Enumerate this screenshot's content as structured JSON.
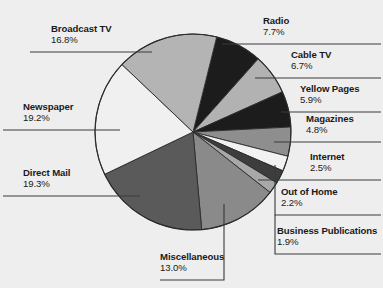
{
  "chart_data": {
    "type": "pie",
    "title": "",
    "subtitle": "",
    "xlabel": "",
    "ylabel": "",
    "legend_position": "callout-labels",
    "grid": false,
    "unit": "%",
    "categories": [
      "Radio",
      "Cable TV",
      "Yellow Pages",
      "Magazines",
      "Internet",
      "Out of Home",
      "Business Publications",
      "Miscellaneous",
      "Direct Mail",
      "Newspaper",
      "Broadcast TV"
    ],
    "values": [
      7.7,
      6.7,
      5.9,
      4.8,
      2.5,
      2.2,
      1.9,
      13.0,
      19.3,
      19.2,
      16.8
    ],
    "value_labels": [
      "7.7%",
      "6.7%",
      "5.9%",
      "4.8%",
      "2.5%",
      "2.2%",
      "1.9%",
      "13.0%",
      "19.3%",
      "19.2%",
      "16.8%"
    ],
    "slice_colors": [
      "#1c1c1c",
      "#b2b2b2",
      "#1c1c1c",
      "#8e8e8e",
      "#f2f2f2",
      "#3d3d3d",
      "#a8a8a8",
      "#8a8a8a",
      "#5a5a5a",
      "#f0f0f0",
      "#b4b4b4"
    ],
    "total": 100.0
  },
  "style": {
    "background": "#eeeeee",
    "text_color": "#1a1a1a",
    "outline_color": "#2b2b2b",
    "leader_color": "#3a3a3a"
  },
  "labels": {
    "radio": {
      "name": "Radio",
      "pct": "7.7%"
    },
    "cable_tv": {
      "name": "Cable TV",
      "pct": "6.7%"
    },
    "yellow_pages": {
      "name": "Yellow Pages",
      "pct": "5.9%"
    },
    "magazines": {
      "name": "Magazines",
      "pct": "4.8%"
    },
    "internet": {
      "name": "Internet",
      "pct": "2.5%"
    },
    "out_of_home": {
      "name": "Out of Home",
      "pct": "2.2%"
    },
    "business_publications": {
      "name": "Business Publications",
      "pct": "1.9%"
    },
    "miscellaneous": {
      "name": "Miscellaneous",
      "pct": "13.0%"
    },
    "direct_mail": {
      "name": "Direct Mail",
      "pct": "19.3%"
    },
    "newspaper": {
      "name": "Newspaper",
      "pct": "19.2%"
    },
    "broadcast_tv": {
      "name": "Broadcast TV",
      "pct": "16.8%"
    }
  }
}
